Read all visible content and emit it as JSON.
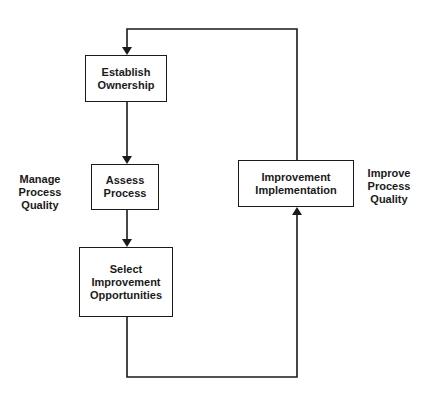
{
  "diagram": {
    "type": "flowchart-loop",
    "nodes": [
      {
        "id": "establish",
        "lines": [
          "Establish",
          "Ownership"
        ]
      },
      {
        "id": "assess",
        "lines": [
          "Assess",
          "Process"
        ]
      },
      {
        "id": "select",
        "lines": [
          "Select",
          "Improvement",
          "Opportunities"
        ]
      },
      {
        "id": "implement",
        "lines": [
          "Improvement",
          "Implementation"
        ]
      }
    ],
    "edges": [
      {
        "from": "establish",
        "to": "assess"
      },
      {
        "from": "assess",
        "to": "select"
      },
      {
        "from": "select",
        "to": "implement"
      },
      {
        "from": "implement",
        "to": "establish"
      }
    ],
    "side_labels": {
      "left": [
        "Manage",
        "Process",
        "Quality"
      ],
      "right": [
        "Improve",
        "Process",
        "Quality"
      ]
    },
    "colors": {
      "line": "#1a1a1a",
      "background": "#ffffff"
    }
  }
}
